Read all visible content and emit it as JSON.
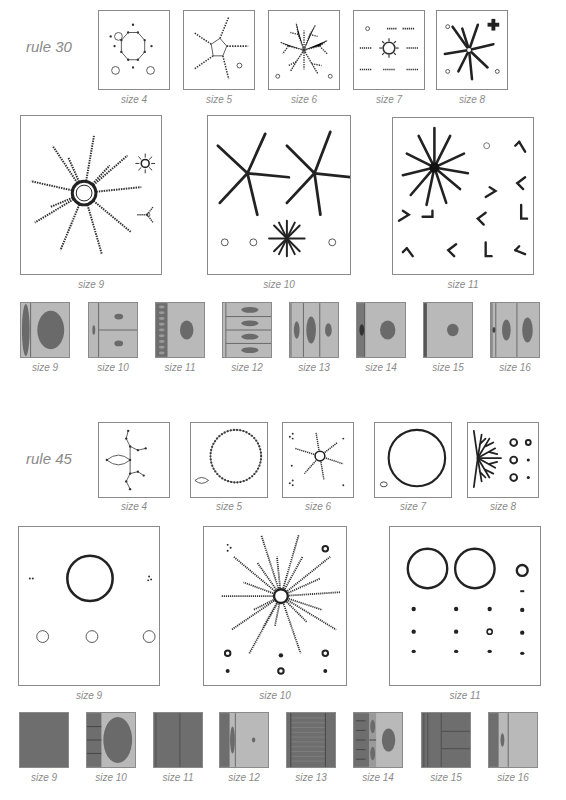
{
  "sections": [
    {
      "label": "rule 30",
      "row1": [
        "size 4",
        "size 5",
        "size 6",
        "size 7",
        "size 8"
      ],
      "row2": [
        "size 9",
        "size 10",
        "size 11"
      ],
      "row3": [
        "size 9",
        "size 10",
        "size 11",
        "size 12",
        "size 13",
        "size 14",
        "size 15",
        "size 16"
      ]
    },
    {
      "label": "rule 45",
      "row1": [
        "size 4",
        "size 5",
        "size 6",
        "size 7",
        "size 8"
      ],
      "row2": [
        "size 9",
        "size 10",
        "size 11"
      ],
      "row3": [
        "size 9",
        "size 10",
        "size 11",
        "size 12",
        "size 13",
        "size 14",
        "size 15",
        "size 16"
      ]
    }
  ],
  "colors": {
    "frame": "#8a8a8a",
    "ink": "#2a2a2a",
    "light_gray": "#b9b9b9",
    "dark_gray": "#6e6e6e",
    "ellipse": "#6a6a6a"
  }
}
